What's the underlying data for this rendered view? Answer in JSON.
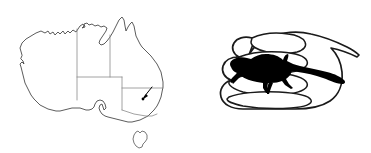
{
  "figure": {
    "background_color": "#ffffff",
    "width": 371,
    "height": 153,
    "panel_count": 2
  },
  "map_panel": {
    "name": "australia-distribution-map",
    "subject": "Australia",
    "outline_color": "#4a4a4a",
    "border_color": "#8a8a8a",
    "fill_color": "#ffffff",
    "has_labels": false,
    "states_shown": [
      "Western Australia",
      "Northern Territory",
      "South Australia",
      "Queensland",
      "New South Wales",
      "Victoria",
      "Tasmania"
    ],
    "island": {
      "name": "Tasmania",
      "separated": true
    },
    "locality_marker": {
      "icon": "arrow-icon",
      "color": "#000000",
      "direction": "down-left",
      "region": "southeastern Australia",
      "approx_state": "New South Wales / Victoria border area"
    }
  },
  "scale_panel": {
    "name": "hand-scale-reference",
    "hand": {
      "icon": "open-hand-icon",
      "orientation": "palm-up, fingers pointing left",
      "line_color": "#1a1a1a",
      "fill_color": "#ffffff",
      "finger_count": 4,
      "style": "line drawing"
    },
    "animal": {
      "icon": "lizard-silhouette-icon",
      "type": "lizard",
      "silhouette_color": "#000000",
      "orientation": "facing left, tail extending right",
      "purpose": "body size scale comparison"
    }
  }
}
